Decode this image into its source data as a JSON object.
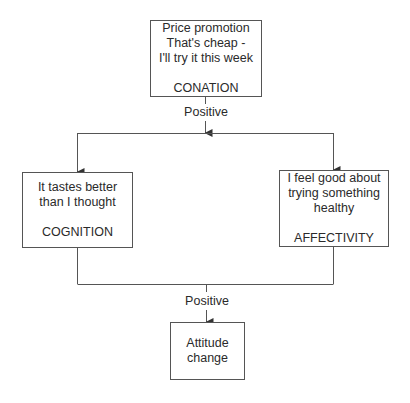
{
  "diagram": {
    "type": "flowchart",
    "nodes": {
      "conation": {
        "text_lines": [
          "Price promotion",
          "That's cheap -",
          "I'll try it this week"
        ],
        "category": "CONATION"
      },
      "cognition": {
        "text_lines": [
          "It tastes better",
          "than I thought"
        ],
        "category": "COGNITION"
      },
      "affectivity": {
        "text_lines": [
          "I feel good about",
          "trying something",
          "healthy"
        ],
        "category": "AFFECTIVITY"
      },
      "attitude": {
        "text_lines": [
          "Attitude",
          "change"
        ]
      }
    },
    "edges": [
      {
        "from": "conation",
        "to": [
          "cognition",
          "affectivity"
        ],
        "label": "Positive"
      },
      {
        "from": [
          "cognition",
          "affectivity"
        ],
        "to": "attitude",
        "label": "Positive"
      }
    ],
    "labels": {
      "top_edge": "Positive",
      "bottom_edge": "Positive"
    },
    "colors": {
      "line": "#555555",
      "text": "#2a2a2a",
      "background": "#ffffff"
    }
  }
}
